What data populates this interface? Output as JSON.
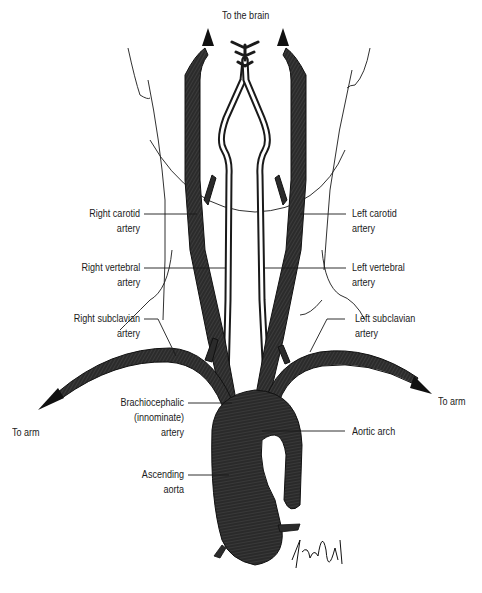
{
  "diagram": {
    "colors": {
      "vessel_fill": "#2b2b2b",
      "vessel_stroke": "#111111",
      "vessel_stripe": "#5a5a5a",
      "outline": "#1a1a1a",
      "background": "#ffffff"
    },
    "labels": {
      "to_brain": "To the brain",
      "right_carotid": [
        "Right carotid",
        "artery"
      ],
      "left_carotid": [
        "Left carotid",
        "artery"
      ],
      "right_vertebral": [
        "Right vertebral",
        "artery"
      ],
      "left_vertebral": [
        "Left vertebral",
        "artery"
      ],
      "right_subclavian": [
        "Right subclavian",
        "artery"
      ],
      "left_subclavian": [
        "Left subclavian",
        "artery"
      ],
      "brachiocephalic": [
        "Brachiocephalic",
        "(innominate)",
        "artery"
      ],
      "aortic_arch": "Aortic arch",
      "ascending_aorta": [
        "Ascending",
        "aorta"
      ],
      "to_arm_left": "To arm",
      "to_arm_right": "To arm"
    },
    "signature": "H. Smith"
  }
}
